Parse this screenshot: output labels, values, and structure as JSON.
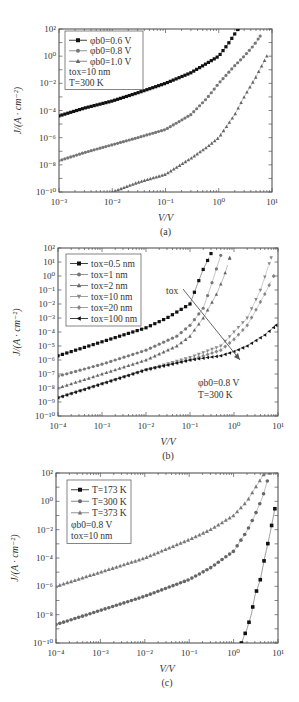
{
  "chart_data": [
    {
      "id": "a",
      "type": "scatter",
      "caption": "(a)",
      "xlabel": "V/V",
      "ylabel": "J/(A · cm⁻²)",
      "xscale": "log",
      "yscale": "log",
      "xlim": [
        0.001,
        10
      ],
      "ylim": [
        1e-10,
        100
      ],
      "xticks": [
        "10⁻³",
        "10⁻²",
        "10⁻¹",
        "10⁰",
        "10¹"
      ],
      "yticks": [
        "10⁻¹⁰",
        "10⁻⁸",
        "10⁻⁶",
        "10⁻⁴",
        "10⁻²",
        "10⁰",
        "10²"
      ],
      "legend_position": "upper left",
      "annotations": [
        "t_ox=10 nm",
        "T=300 K"
      ],
      "series": [
        {
          "name": "φb0=0.6 V",
          "marker": "square",
          "color": "#111111",
          "x": [
            0.001,
            0.003,
            0.01,
            0.03,
            0.1,
            0.3,
            0.6,
            1.0,
            1.5,
            2.3
          ],
          "y": [
            4e-05,
            0.00015,
            0.0005,
            0.002,
            0.01,
            0.06,
            0.3,
            1.0,
            8,
            100
          ]
        },
        {
          "name": "φb0=0.8 V",
          "marker": "circle",
          "color": "#777777",
          "x": [
            0.001,
            0.003,
            0.01,
            0.03,
            0.1,
            0.3,
            0.6,
            1.0,
            2.0,
            3.0,
            4.5,
            6.0
          ],
          "y": [
            2e-08,
            8e-08,
            3e-07,
            1e-06,
            4e-06,
            5e-05,
            0.0008,
            0.01,
            0.2,
            1.0,
            6,
            30
          ]
        },
        {
          "name": "φb0=1.0 V",
          "marker": "triangle",
          "color": "#666666",
          "x": [
            0.01,
            0.03,
            0.1,
            0.3,
            0.6,
            1.0,
            2.0,
            3.0,
            5.0,
            8.0
          ],
          "y": [
            1e-10,
            5e-10,
            2e-09,
            3e-08,
            2e-07,
            1e-06,
            5e-05,
            0.001,
            0.03,
            1.0
          ]
        }
      ]
    },
    {
      "id": "b",
      "type": "scatter",
      "caption": "(b)",
      "xlabel": "V/V",
      "ylabel": "J/(A · cm⁻²)",
      "xscale": "log",
      "yscale": "log",
      "xlim": [
        0.0001,
        10
      ],
      "ylim": [
        1e-10,
        100
      ],
      "xticks": [
        "10⁻⁴",
        "10⁻³",
        "10⁻²",
        "10⁻¹",
        "10⁰",
        "10¹"
      ],
      "yticks": [
        "10⁻¹⁰",
        "10⁻⁹",
        "10⁻⁸",
        "10⁻⁷",
        "10⁻⁶",
        "10⁻⁵",
        "10⁻⁴",
        "10⁻³",
        "10⁻²",
        "10⁻¹",
        "10⁰",
        "10¹",
        "10²"
      ],
      "legend_position": "upper left",
      "annotations": [
        "t_ox (arrow: increasing)",
        "φb0=0.8 V",
        "T=300 K"
      ],
      "series": [
        {
          "name": "t_ox=0.5 nm",
          "marker": "square",
          "color": "#111111",
          "x": [
            0.0001,
            0.001,
            0.01,
            0.03,
            0.1,
            0.15,
            0.2,
            0.3
          ],
          "y": [
            2e-06,
            2e-05,
            0.0002,
            0.001,
            0.01,
            0.3,
            3,
            40
          ]
        },
        {
          "name": "t_ox=1 nm",
          "marker": "circle",
          "color": "#777777",
          "x": [
            0.0001,
            0.001,
            0.01,
            0.05,
            0.1,
            0.2,
            0.3,
            0.5
          ],
          "y": [
            7e-08,
            5e-07,
            5e-06,
            5e-05,
            0.0003,
            0.005,
            0.2,
            30
          ]
        },
        {
          "name": "t_ox=2 nm",
          "marker": "triangle-up",
          "color": "#666666",
          "x": [
            0.0001,
            0.001,
            0.01,
            0.05,
            0.1,
            0.2,
            0.4,
            0.6,
            0.8
          ],
          "y": [
            1e-08,
            1e-07,
            1e-06,
            1e-05,
            5e-05,
            0.001,
            0.05,
            1,
            20
          ]
        },
        {
          "name": "t_ox=10 nm",
          "marker": "triangle-down",
          "color": "#888888",
          "x": [
            0.0001,
            0.001,
            0.01,
            0.1,
            0.5,
            1.0,
            2.0,
            4.0,
            7.0
          ],
          "y": [
            2e-09,
            2e-08,
            2e-07,
            1.5e-06,
            1e-05,
            0.0001,
            0.001,
            0.1,
            20
          ]
        },
        {
          "name": "t_ox=20 nm",
          "marker": "diamond",
          "color": "#888888",
          "x": [
            0.0001,
            0.001,
            0.01,
            0.1,
            0.5,
            1.0,
            2.0,
            5.0,
            8.0
          ],
          "y": [
            2e-09,
            2e-08,
            2e-07,
            1e-06,
            5e-06,
            3e-05,
            0.0003,
            0.05,
            1
          ]
        },
        {
          "name": "t_ox=100 nm",
          "marker": "triangle-left",
          "color": "#111111",
          "x": [
            0.0001,
            0.001,
            0.01,
            0.1,
            0.5,
            1.0,
            2.0,
            5.0,
            9.0
          ],
          "y": [
            2e-09,
            2e-08,
            2e-07,
            1e-06,
            2e-06,
            4e-06,
            1e-05,
            6e-05,
            0.0003
          ]
        }
      ]
    },
    {
      "id": "c",
      "type": "scatter",
      "caption": "(c)",
      "xlabel": "V/V",
      "ylabel": "J/(A · cm⁻²)",
      "xscale": "log",
      "yscale": "log",
      "xlim": [
        0.0001,
        10
      ],
      "ylim": [
        1e-10,
        100
      ],
      "xticks": [
        "10⁻⁴",
        "10⁻³",
        "10⁻²",
        "10⁻¹",
        "10⁰",
        "10¹"
      ],
      "yticks": [
        "10⁻¹⁰",
        "10⁻⁸",
        "10⁻⁶",
        "10⁻⁴",
        "10⁻²",
        "10⁰",
        "10²"
      ],
      "legend_position": "upper left",
      "annotations": [
        "φb0=0.8 V",
        "t_ox=10 nm"
      ],
      "series": [
        {
          "name": "T=173 K",
          "marker": "square",
          "color": "#111111",
          "x": [
            1.5,
            2.0,
            2.5,
            3.0,
            4.0,
            5.0,
            6.5,
            8.5
          ],
          "y": [
            1e-10,
            1e-09,
            1e-08,
            2e-07,
            3e-06,
            0.0001,
            0.004,
            0.3
          ]
        },
        {
          "name": "T=300 K",
          "marker": "circle",
          "color": "#666666",
          "x": [
            0.0001,
            0.001,
            0.01,
            0.1,
            0.3,
            1.0,
            2.0,
            3.0,
            4.5,
            6.5
          ],
          "y": [
            2e-09,
            2e-08,
            2e-07,
            3e-06,
            2e-05,
            0.0003,
            0.008,
            0.1,
            2,
            100
          ]
        },
        {
          "name": "T=373 K",
          "marker": "triangle",
          "color": "#777777",
          "x": [
            0.0001,
            0.001,
            0.01,
            0.1,
            0.3,
            1.0,
            2.0,
            3.0,
            5.0
          ],
          "y": [
            1e-06,
            1e-05,
            0.0001,
            0.002,
            0.01,
            0.1,
            1,
            8,
            100
          ]
        }
      ]
    }
  ],
  "panels": {
    "a": {
      "caption": "(a)",
      "xlabel": "V/V",
      "ylabel": "J/(A · cm⁻²)",
      "legend": [
        "φb0=0.6 V",
        "φb0=0.8 V",
        "φb0=1.0 V"
      ],
      "notes": [
        "tox=10 nm",
        "T=300 K"
      ]
    },
    "b": {
      "caption": "(b)",
      "xlabel": "V/V",
      "ylabel": "J/(A · cm⁻²)",
      "legend": [
        "tox=0.5 nm",
        "tox=1 nm",
        "tox=2 nm",
        "tox=10 nm",
        "tox=20 nm",
        "tox=100 nm"
      ],
      "notes": [
        "φb0=0.8 V",
        "T=300 K"
      ],
      "arrow_label": "tox"
    },
    "c": {
      "caption": "(c)",
      "xlabel": "V/V",
      "ylabel": "J/(A · cm⁻²)",
      "legend": [
        "T=173 K",
        "T=300 K",
        "T=373 K"
      ],
      "notes": [
        "φb0=0.8 V",
        "tox=10 nm"
      ]
    }
  }
}
